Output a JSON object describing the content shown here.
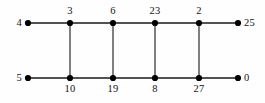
{
  "figure": {
    "kind": "ladder-graph-labeling",
    "background_color": "#fefefe",
    "edge_color": "#1a1a1a",
    "rung_color": "#55555a",
    "vertex_color": "#000000",
    "width": 265,
    "height": 103
  },
  "chart_data": {
    "type": "diagram",
    "title": "",
    "nodes": [
      {
        "id": "t0",
        "label": "4",
        "x": 28,
        "y": 23,
        "row": "top",
        "label_pos": "left"
      },
      {
        "id": "t1",
        "label": "3",
        "x": 70,
        "y": 23,
        "row": "top",
        "label_pos": "above"
      },
      {
        "id": "t2",
        "label": "6",
        "x": 113,
        "y": 23,
        "row": "top",
        "label_pos": "above"
      },
      {
        "id": "t3",
        "label": "23",
        "x": 155,
        "y": 23,
        "row": "top",
        "label_pos": "above"
      },
      {
        "id": "t4",
        "label": "2",
        "x": 199,
        "y": 23,
        "row": "top",
        "label_pos": "above"
      },
      {
        "id": "t5",
        "label": "25",
        "x": 238,
        "y": 23,
        "row": "top",
        "label_pos": "right"
      },
      {
        "id": "b0",
        "label": "5",
        "x": 28,
        "y": 78,
        "row": "bottom",
        "label_pos": "left"
      },
      {
        "id": "b1",
        "label": "10",
        "x": 70,
        "y": 78,
        "row": "bottom",
        "label_pos": "below"
      },
      {
        "id": "b2",
        "label": "19",
        "x": 113,
        "y": 78,
        "row": "bottom",
        "label_pos": "below"
      },
      {
        "id": "b3",
        "label": "8",
        "x": 155,
        "y": 78,
        "row": "bottom",
        "label_pos": "below"
      },
      {
        "id": "b4",
        "label": "27",
        "x": 199,
        "y": 78,
        "row": "bottom",
        "label_pos": "below"
      },
      {
        "id": "b5",
        "label": "0",
        "x": 238,
        "y": 78,
        "row": "bottom",
        "label_pos": "right"
      }
    ],
    "edges": [
      {
        "from": "t0",
        "to": "t1",
        "orientation": "horizontal"
      },
      {
        "from": "t1",
        "to": "t2",
        "orientation": "horizontal"
      },
      {
        "from": "t2",
        "to": "t3",
        "orientation": "horizontal"
      },
      {
        "from": "t3",
        "to": "t4",
        "orientation": "horizontal"
      },
      {
        "from": "t4",
        "to": "t5",
        "orientation": "horizontal"
      },
      {
        "from": "b0",
        "to": "b1",
        "orientation": "horizontal"
      },
      {
        "from": "b1",
        "to": "b2",
        "orientation": "horizontal"
      },
      {
        "from": "b2",
        "to": "b3",
        "orientation": "horizontal"
      },
      {
        "from": "b3",
        "to": "b4",
        "orientation": "horizontal"
      },
      {
        "from": "b4",
        "to": "b5",
        "orientation": "horizontal"
      },
      {
        "from": "t1",
        "to": "b1",
        "orientation": "vertical"
      },
      {
        "from": "t2",
        "to": "b2",
        "orientation": "vertical"
      },
      {
        "from": "t3",
        "to": "b3",
        "orientation": "vertical"
      },
      {
        "from": "t4",
        "to": "b4",
        "orientation": "vertical"
      }
    ],
    "top_row_labels": [
      "4",
      "3",
      "6",
      "23",
      "2",
      "25"
    ],
    "bottom_row_labels": [
      "5",
      "10",
      "19",
      "8",
      "27",
      "0"
    ]
  }
}
